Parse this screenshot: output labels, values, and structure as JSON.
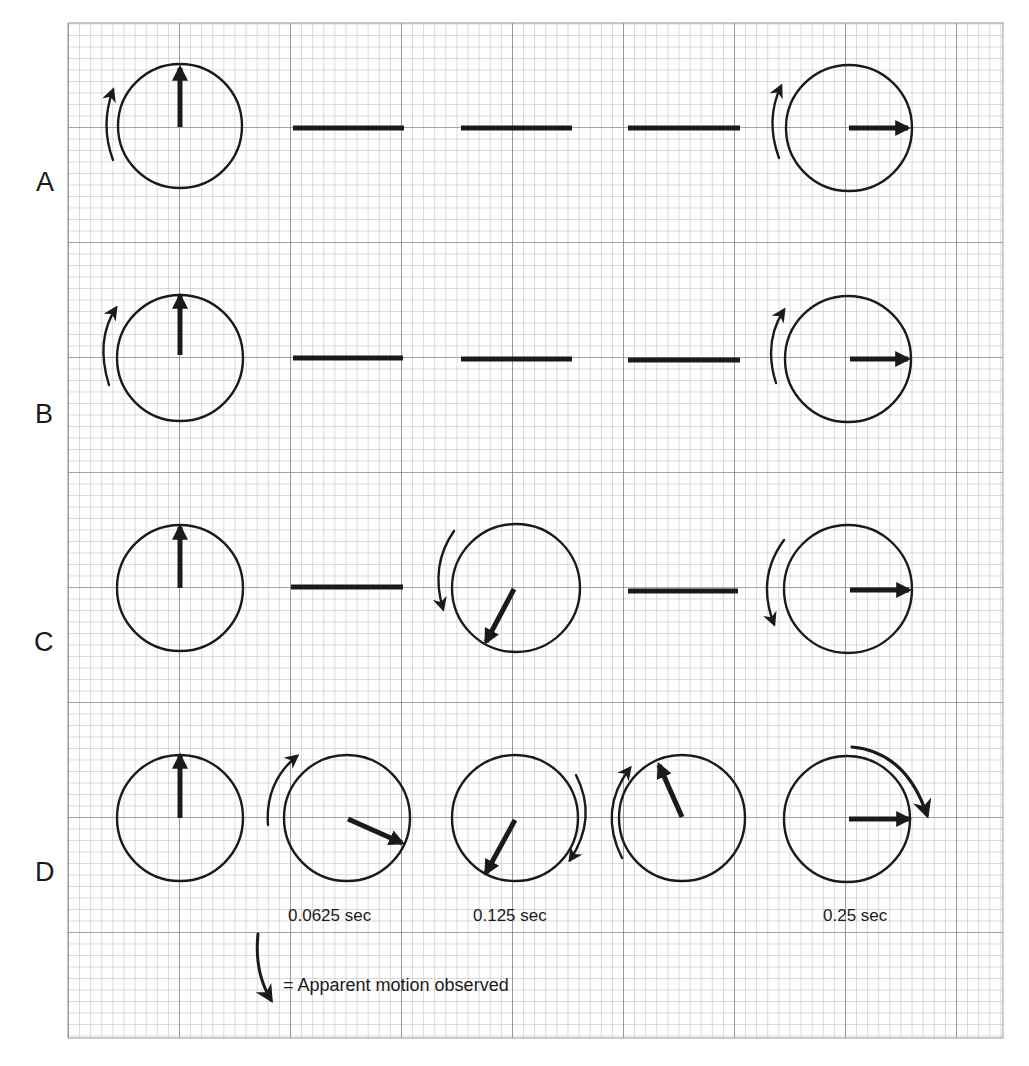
{
  "figure": {
    "row_labels": [
      "A",
      "B",
      "C",
      "D"
    ],
    "time_labels": [
      {
        "text": "0.0625 sec",
        "column": 2
      },
      {
        "text": "0.125 sec",
        "column": 3
      },
      {
        "text": "0.25 sec",
        "column": 5
      }
    ],
    "legend": {
      "icon": "curved-arrow-icon",
      "text": "= Apparent motion observed"
    },
    "colors": {
      "ink": "#1a1a1a",
      "grid_minor": "#b5b5b5",
      "grid_major": "#6e6e6e",
      "background": "#ffffff"
    },
    "rows": [
      {
        "label": "A",
        "cells": [
          {
            "type": "dial",
            "hand_angle_deg": 0,
            "apparent_motion": "counterclockwise-up"
          },
          {
            "type": "blank-dash"
          },
          {
            "type": "blank-dash"
          },
          {
            "type": "blank-dash"
          },
          {
            "type": "dial",
            "hand_angle_deg": 90,
            "apparent_motion": "counterclockwise-up"
          }
        ]
      },
      {
        "label": "B",
        "cells": [
          {
            "type": "dial",
            "hand_angle_deg": 0,
            "apparent_motion": "counterclockwise-up"
          },
          {
            "type": "blank-dash"
          },
          {
            "type": "blank-dash"
          },
          {
            "type": "blank-dash"
          },
          {
            "type": "dial",
            "hand_angle_deg": 90,
            "apparent_motion": "counterclockwise-up"
          }
        ]
      },
      {
        "label": "C",
        "cells": [
          {
            "type": "dial",
            "hand_angle_deg": 0,
            "apparent_motion": "none"
          },
          {
            "type": "blank-dash"
          },
          {
            "type": "dial",
            "hand_angle_deg": 210,
            "apparent_motion": "counterclockwise-down"
          },
          {
            "type": "blank-dash"
          },
          {
            "type": "dial",
            "hand_angle_deg": 90,
            "apparent_motion": "counterclockwise-down"
          }
        ]
      },
      {
        "label": "D",
        "cells": [
          {
            "type": "dial",
            "hand_angle_deg": 0,
            "apparent_motion": "none"
          },
          {
            "type": "dial",
            "hand_angle_deg": 115,
            "apparent_motion": "clockwise-up"
          },
          {
            "type": "dial",
            "hand_angle_deg": 210,
            "apparent_motion": "clockwise-down"
          },
          {
            "type": "dial",
            "hand_angle_deg": 335,
            "apparent_motion": "clockwise-up"
          },
          {
            "type": "dial",
            "hand_angle_deg": 90,
            "apparent_motion": "clockwise-top-right"
          }
        ]
      }
    ]
  }
}
